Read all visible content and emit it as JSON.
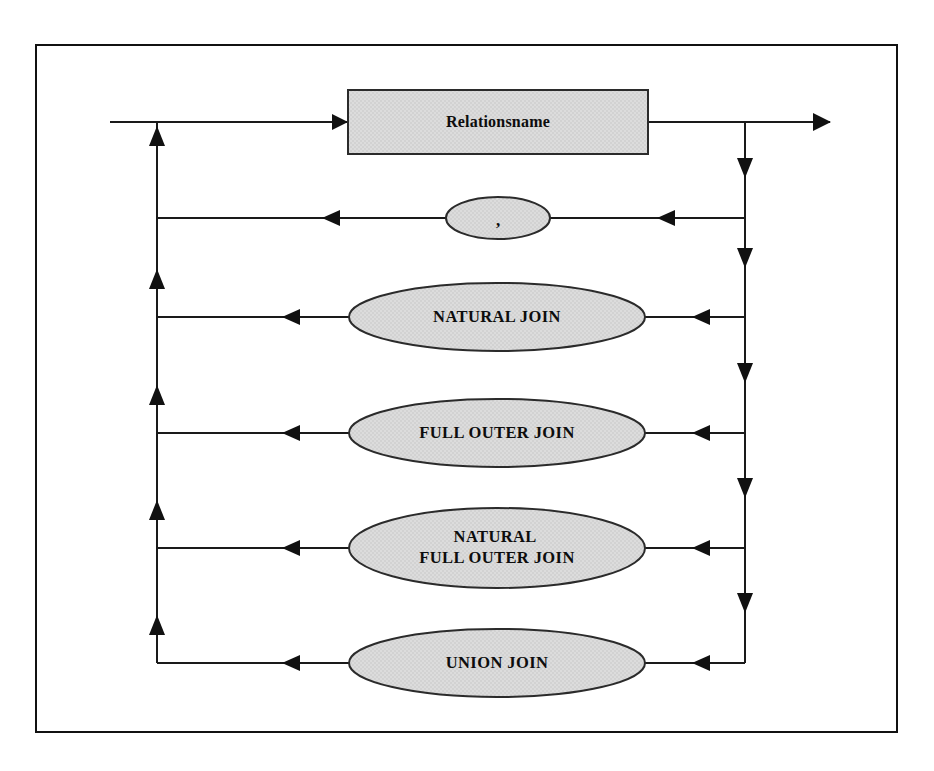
{
  "diagram": {
    "kind": "railroad-syntax-diagram",
    "frame": {
      "name": "outer-border",
      "x": 35,
      "y": 44,
      "width": 863,
      "height": 689,
      "stroke": "#111111",
      "stroke_width": 2,
      "fill": "#ffffff"
    },
    "colors": {
      "line": "#1a1a1a",
      "node_fill": "#d9d9d9",
      "node_stroke": "#2b2b2b",
      "text": "#0d0d0d",
      "background": "#ffffff"
    },
    "rails": {
      "left_rail_x": 157,
      "right_rail_x": 745,
      "entry_x": 110,
      "exit_x": 830,
      "main_y": 122,
      "bottom_y": 663
    },
    "nodes": [
      {
        "id": "relationsname",
        "shape": "rect",
        "label": "Relationsname",
        "lines": [
          "Relationsname"
        ],
        "cx": 498,
        "cy": 122,
        "width": 300,
        "height": 64,
        "row_y": 122
      },
      {
        "id": "comma",
        "shape": "ellipse",
        "label": ",",
        "lines": [
          ","
        ],
        "cx": 498,
        "cy": 218,
        "rx": 52,
        "ry": 21,
        "row_y": 218
      },
      {
        "id": "natural-join",
        "shape": "ellipse",
        "label": "NATURAL JOIN",
        "lines": [
          "NATURAL JOIN"
        ],
        "cx": 497,
        "cy": 317,
        "rx": 148,
        "ry": 34,
        "row_y": 317
      },
      {
        "id": "full-outer-join",
        "shape": "ellipse",
        "label": "FULL OUTER JOIN",
        "lines": [
          "FULL OUTER JOIN"
        ],
        "cx": 497,
        "cy": 433,
        "rx": 148,
        "ry": 34,
        "row_y": 433
      },
      {
        "id": "natural-full-outer-join",
        "shape": "ellipse",
        "label": "NATURAL FULL OUTER JOIN",
        "lines": [
          "NATURAL",
          "FULL OUTER JOIN"
        ],
        "cx": 497,
        "cy": 548,
        "rx": 148,
        "ry": 40,
        "row_y": 548
      },
      {
        "id": "union-join",
        "shape": "ellipse",
        "label": "UNION JOIN",
        "lines": [
          "UNION JOIN"
        ],
        "cx": 497,
        "cy": 663,
        "rx": 148,
        "ry": 34,
        "row_y": 663
      }
    ],
    "arrows": {
      "entry_into_box": {
        "x": 345,
        "y": 122,
        "direction": "right"
      },
      "exit_right": {
        "x": 830,
        "y": 122,
        "direction": "right"
      },
      "left_rail_up": [
        {
          "x": 157,
          "y": 131
        },
        {
          "x": 157,
          "y": 274
        },
        {
          "x": 157,
          "y": 390
        },
        {
          "x": 157,
          "y": 505
        },
        {
          "x": 157,
          "y": 620
        }
      ],
      "right_rail_down": [
        {
          "x": 745,
          "y": 175
        },
        {
          "x": 745,
          "y": 263
        },
        {
          "x": 745,
          "y": 378
        },
        {
          "x": 745,
          "y": 493
        },
        {
          "x": 745,
          "y": 608
        }
      ],
      "branch_left_heads": [
        {
          "x": 330,
          "y": 218
        },
        {
          "x": 290,
          "y": 317
        },
        {
          "x": 290,
          "y": 433
        },
        {
          "x": 290,
          "y": 548
        },
        {
          "x": 290,
          "y": 663
        }
      ],
      "branch_right_heads": [
        {
          "x": 665,
          "y": 218
        },
        {
          "x": 700,
          "y": 317
        },
        {
          "x": 700,
          "y": 433
        },
        {
          "x": 700,
          "y": 548
        },
        {
          "x": 700,
          "y": 663
        }
      ]
    }
  }
}
